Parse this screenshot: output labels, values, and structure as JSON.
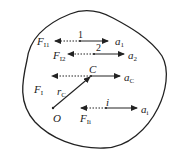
{
  "diagram": {
    "type": "rigid-body-particle-force-diagram",
    "boundary": {
      "shape": "closed-irregular-blob",
      "stroke": "#222222"
    },
    "particles": [
      {
        "id": "1",
        "label": "1",
        "inertial_force": {
          "symbol": "F",
          "sub": "I1"
        },
        "acceleration": {
          "symbol": "a",
          "sub": "1"
        }
      },
      {
        "id": "2",
        "label": "2",
        "inertial_force": {
          "symbol": "F",
          "sub": "I2"
        },
        "acceleration": {
          "symbol": "a",
          "sub": "2"
        }
      },
      {
        "id": "i",
        "label": "i",
        "inertial_force": {
          "symbol": "F",
          "sub": "Ii"
        },
        "acceleration": {
          "symbol": "a",
          "sub": "i"
        }
      }
    ],
    "center_of_mass": {
      "label": "C",
      "inertial_force": {
        "symbol": "F",
        "sub": "I"
      },
      "acceleration": {
        "symbol": "a",
        "sub": "C"
      }
    },
    "origin": {
      "label": "O"
    },
    "position_vector": {
      "symbol": "r",
      "sub": "C"
    },
    "legend": {
      "solid_arrow": "acceleration",
      "dotted_arrow": "inertial force"
    }
  }
}
